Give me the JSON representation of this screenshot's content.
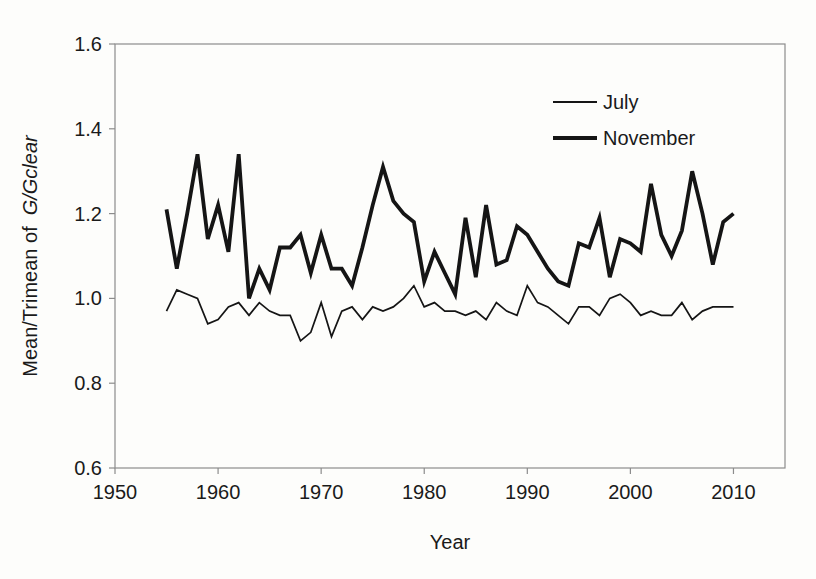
{
  "figure": {
    "background_color": "#fdfdfb",
    "axis_color": "#8c8c8c",
    "text_color": "#1a1a1a",
    "line_color": "#151515"
  },
  "chart_data": {
    "type": "line",
    "title": "",
    "xlabel": "Year",
    "ylabel_plain": "Mean/Trimean of",
    "ylabel_italic": "G/Gclear",
    "grid": false,
    "legend_position": "upper-right-inside",
    "xlim": [
      1950,
      2015
    ],
    "ylim": [
      0.6,
      1.6
    ],
    "x_ticks": [
      1950,
      1960,
      1970,
      1980,
      1990,
      2000,
      2010
    ],
    "y_ticks": [
      "0.6",
      "0.8",
      "1.0",
      "1.2",
      "1.4",
      "1.6"
    ],
    "x": [
      1955,
      1956,
      1957,
      1958,
      1959,
      1960,
      1961,
      1962,
      1963,
      1964,
      1965,
      1966,
      1967,
      1968,
      1969,
      1970,
      1971,
      1972,
      1973,
      1974,
      1975,
      1976,
      1977,
      1978,
      1979,
      1980,
      1981,
      1982,
      1983,
      1984,
      1985,
      1986,
      1987,
      1988,
      1989,
      1990,
      1991,
      1992,
      1993,
      1994,
      1995,
      1996,
      1997,
      1998,
      1999,
      2000,
      2001,
      2002,
      2003,
      2004,
      2005,
      2006,
      2007,
      2008,
      2009,
      2010
    ],
    "series": [
      {
        "name": "July",
        "stroke_width": 1.7,
        "values": [
          0.97,
          1.02,
          1.01,
          1.0,
          0.94,
          0.95,
          0.98,
          0.99,
          0.96,
          0.99,
          0.97,
          0.96,
          0.96,
          0.9,
          0.92,
          0.99,
          0.91,
          0.97,
          0.98,
          0.95,
          0.98,
          0.97,
          0.98,
          1.0,
          1.03,
          0.98,
          0.99,
          0.97,
          0.97,
          0.96,
          0.97,
          0.95,
          0.99,
          0.97,
          0.96,
          1.03,
          0.99,
          0.98,
          0.96,
          0.94,
          0.98,
          0.98,
          0.96,
          1.0,
          1.01,
          0.99,
          0.96,
          0.97,
          0.96,
          0.96,
          0.99,
          0.95,
          0.97,
          0.98,
          0.98,
          0.98
        ]
      },
      {
        "name": "November",
        "stroke_width": 3.8,
        "values": [
          1.21,
          1.07,
          1.2,
          1.34,
          1.14,
          1.22,
          1.11,
          1.34,
          1.0,
          1.07,
          1.02,
          1.12,
          1.12,
          1.15,
          1.06,
          1.15,
          1.07,
          1.07,
          1.03,
          1.12,
          1.22,
          1.31,
          1.23,
          1.2,
          1.18,
          1.04,
          1.11,
          1.06,
          1.01,
          1.19,
          1.05,
          1.22,
          1.08,
          1.09,
          1.17,
          1.15,
          1.11,
          1.07,
          1.04,
          1.03,
          1.13,
          1.12,
          1.19,
          1.05,
          1.14,
          1.13,
          1.11,
          1.27,
          1.15,
          1.1,
          1.16,
          1.3,
          1.2,
          1.08,
          1.18,
          1.2
        ]
      }
    ]
  }
}
